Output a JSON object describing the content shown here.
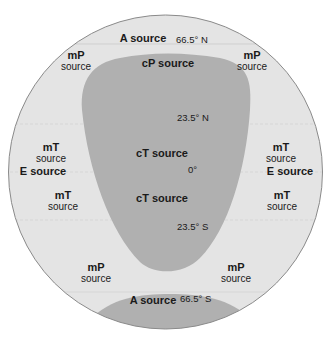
{
  "colors": {
    "background": "#ffffff",
    "globe_fill": "#e4e4e4",
    "continent_fill": "#b0b0b0",
    "outline": "#8a8a8a",
    "latitude_line": "#d0d0d0",
    "text": "#1a1a1a"
  },
  "latitudes": {
    "n66": "66.5° N",
    "n23": "23.5° N",
    "eq": "0°",
    "s23": "23.5° S",
    "s66": "66.5° S"
  },
  "labels": {
    "a_north": "A source",
    "a_south": "A source",
    "cp": "cP source",
    "ct_north": "cT source",
    "ct_south": "cT source",
    "mp_nw": {
      "code": "mP",
      "word": "source"
    },
    "mp_ne": {
      "code": "mP",
      "word": "source"
    },
    "mp_sw": {
      "code": "mP",
      "word": "source"
    },
    "mp_se": {
      "code": "mP",
      "word": "source"
    },
    "mt_nw": {
      "code": "mT",
      "word": "source"
    },
    "mt_ne": {
      "code": "mT",
      "word": "source"
    },
    "mt_sw": {
      "code": "mT",
      "word": "source"
    },
    "mt_se": {
      "code": "mT",
      "word": "source"
    },
    "e_west": "E source",
    "e_east": "E source"
  }
}
